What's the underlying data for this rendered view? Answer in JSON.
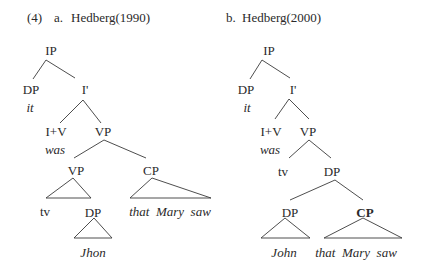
{
  "example": {
    "number": "(4)",
    "a": {
      "letter": "a.",
      "title": "Hedberg(1990)"
    },
    "b": {
      "letter": "b.",
      "title": "Hedberg(2000)"
    }
  },
  "tree_a": {
    "ip": "IP",
    "dp_subject": "DP",
    "subject_word": "it",
    "i_bar": "I'",
    "i_v": "I+V",
    "verb_word": "was",
    "vp_top": "VP",
    "vp_inner": "VP",
    "cp": "CP",
    "cp_words": "that  Mary  saw",
    "trace": "tv",
    "dp_object": "DP",
    "object_word": "Jhon"
  },
  "tree_b": {
    "ip": "IP",
    "dp_subject": "DP",
    "subject_word": "it",
    "i_bar": "I'",
    "i_v": "I+V",
    "verb_word": "was",
    "vp": "VP",
    "trace": "tv",
    "dp_top": "DP",
    "dp_inner": "DP",
    "cp": "CP",
    "dp_words": "John",
    "cp_words": "that  Mary  saw"
  }
}
